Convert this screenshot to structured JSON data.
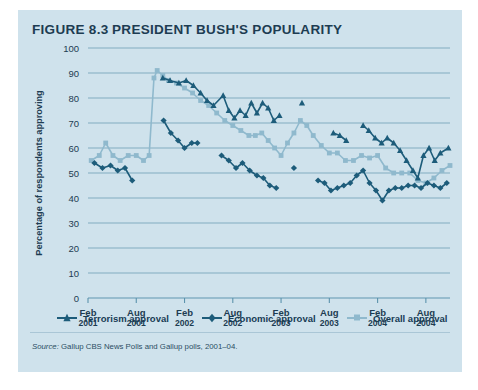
{
  "figure": {
    "number": "FIGURE 8.3",
    "title": "PRESIDENT BUSH'S POPULARITY",
    "source": "Source:",
    "source_text": "Gallup CBS News Polls and Gallup polls, 2001–04."
  },
  "colors": {
    "panel_background": "#cfe2ec",
    "dark_series": "#1d5c7a",
    "light_series": "#8fb9cd",
    "gridline": "#5c93ad",
    "axis_text": "#1d3c52"
  },
  "legend": [
    {
      "label": "Terrorism approval",
      "marker": "triangle",
      "color": "#1d5c7a"
    },
    {
      "label": "Economic approval",
      "marker": "diamond",
      "color": "#1d5c7a"
    },
    {
      "label": "Overall approval",
      "marker": "square",
      "color": "#8fb9cd"
    }
  ],
  "chart_data": {
    "type": "line",
    "title": "President Bush's Popularity",
    "xlabel": "",
    "ylabel": "Percentage of respondents approving",
    "ylim": [
      0,
      100
    ],
    "ytick_step": 10,
    "yticks": [
      0,
      10,
      20,
      30,
      40,
      50,
      60,
      70,
      80,
      90,
      100
    ],
    "grid": "horizontal",
    "legend_position": "bottom",
    "xtick_labels": [
      {
        "month": "Feb",
        "year": "2001"
      },
      {
        "month": "Aug",
        "year": "2001"
      },
      {
        "month": "Feb",
        "year": "2002"
      },
      {
        "month": "Aug",
        "year": "2002"
      },
      {
        "month": "Feb",
        "year": "2003"
      },
      {
        "month": "Aug",
        "year": "2003"
      },
      {
        "month": "Feb",
        "year": "2004"
      },
      {
        "month": "Aug",
        "year": "2004"
      }
    ],
    "x_range_months": [
      0,
      45
    ],
    "x_tick_months": [
      0,
      6,
      12,
      18,
      24,
      30,
      36,
      42
    ],
    "series": [
      {
        "name": "Overall approval",
        "marker": "square",
        "color": "#8fb9cd",
        "points": [
          [
            0.4,
            55
          ],
          [
            1.4,
            57
          ],
          [
            2.2,
            62
          ],
          [
            3.1,
            57
          ],
          [
            4.0,
            55
          ],
          [
            5.0,
            57
          ],
          [
            6.0,
            57
          ],
          [
            6.9,
            55
          ],
          [
            7.6,
            57
          ],
          [
            8.2,
            88
          ],
          [
            8.6,
            91
          ],
          [
            9.3,
            89
          ],
          [
            10.0,
            87
          ],
          [
            11.0,
            86
          ],
          [
            12.0,
            84
          ],
          [
            13.0,
            82
          ],
          [
            14.0,
            79
          ],
          [
            15.0,
            77
          ],
          [
            16.0,
            74
          ],
          [
            17.0,
            71
          ],
          [
            18.0,
            69
          ],
          [
            19.0,
            67
          ],
          [
            20.0,
            65
          ],
          [
            20.8,
            65
          ],
          [
            21.6,
            66
          ],
          [
            22.4,
            63
          ],
          [
            23.2,
            60
          ],
          [
            24.0,
            57
          ],
          [
            24.8,
            62
          ],
          [
            25.6,
            66
          ],
          [
            26.4,
            71
          ],
          [
            27.2,
            69
          ],
          [
            28.0,
            65
          ],
          [
            29.0,
            61
          ],
          [
            30.0,
            58
          ],
          [
            31.0,
            58
          ],
          [
            32.0,
            55
          ],
          [
            33.0,
            55
          ],
          [
            34.0,
            57
          ],
          [
            35.0,
            56
          ],
          [
            36.0,
            57
          ],
          [
            37.0,
            52
          ],
          [
            38.0,
            50
          ],
          [
            39.0,
            50
          ],
          [
            40.0,
            50
          ],
          [
            41.0,
            47
          ],
          [
            42.0,
            46
          ],
          [
            43.0,
            48
          ],
          [
            44.0,
            51
          ],
          [
            45.0,
            53
          ]
        ]
      },
      {
        "name": "Terrorism approval",
        "marker": "triangle",
        "color": "#1d5c7a",
        "points": [
          [
            9.3,
            88
          ],
          [
            10.2,
            87
          ],
          [
            11.3,
            86
          ],
          [
            12.2,
            87
          ],
          [
            13.1,
            85
          ],
          [
            14.0,
            82
          ],
          [
            14.8,
            79
          ],
          [
            15.6,
            77
          ],
          [
            16.8,
            81
          ],
          [
            17.5,
            75
          ],
          [
            18.2,
            72
          ],
          [
            18.9,
            75
          ],
          [
            19.6,
            73
          ],
          [
            20.3,
            78
          ],
          [
            21.0,
            74
          ],
          [
            21.7,
            78
          ],
          [
            22.4,
            76
          ],
          [
            23.1,
            71
          ],
          [
            23.8,
            73
          ],
          [
            26.6,
            78
          ],
          [
            30.5,
            66
          ],
          [
            31.3,
            65
          ],
          [
            32.1,
            63
          ],
          [
            34.2,
            69
          ],
          [
            34.9,
            67
          ],
          [
            35.7,
            64
          ],
          [
            36.5,
            62
          ],
          [
            37.2,
            64
          ],
          [
            38.0,
            62
          ],
          [
            38.8,
            59
          ],
          [
            39.6,
            55
          ],
          [
            40.4,
            51
          ],
          [
            41.0,
            48
          ],
          [
            41.7,
            57
          ],
          [
            42.4,
            60
          ],
          [
            43.1,
            55
          ],
          [
            43.8,
            58
          ],
          [
            44.8,
            60
          ]
        ]
      },
      {
        "name": "Economic approval",
        "marker": "diamond",
        "color": "#1d5c7a",
        "points": [
          [
            0.8,
            54
          ],
          [
            1.8,
            52
          ],
          [
            2.8,
            53
          ],
          [
            3.7,
            51
          ],
          [
            4.6,
            52
          ],
          [
            5.5,
            47
          ],
          [
            9.4,
            71
          ],
          [
            10.3,
            66
          ],
          [
            11.2,
            63
          ],
          [
            12.0,
            60
          ],
          [
            12.9,
            62
          ],
          [
            13.6,
            62
          ],
          [
            16.6,
            57
          ],
          [
            17.5,
            55
          ],
          [
            18.4,
            52
          ],
          [
            19.2,
            54
          ],
          [
            20.1,
            51
          ],
          [
            21.0,
            49
          ],
          [
            21.8,
            48
          ],
          [
            22.6,
            45
          ],
          [
            23.4,
            44
          ],
          [
            25.6,
            52
          ],
          [
            28.6,
            47
          ],
          [
            29.4,
            46
          ],
          [
            30.2,
            43
          ],
          [
            31.0,
            44
          ],
          [
            31.8,
            45
          ],
          [
            32.6,
            46
          ],
          [
            33.4,
            49
          ],
          [
            34.2,
            51
          ],
          [
            35.0,
            46
          ],
          [
            35.8,
            43
          ],
          [
            36.6,
            39
          ],
          [
            37.4,
            43
          ],
          [
            38.2,
            44
          ],
          [
            39.0,
            44
          ],
          [
            39.8,
            45
          ],
          [
            40.6,
            45
          ],
          [
            41.4,
            44
          ],
          [
            42.2,
            46
          ],
          [
            43.0,
            45
          ],
          [
            43.8,
            44
          ],
          [
            44.6,
            46
          ]
        ]
      }
    ]
  }
}
